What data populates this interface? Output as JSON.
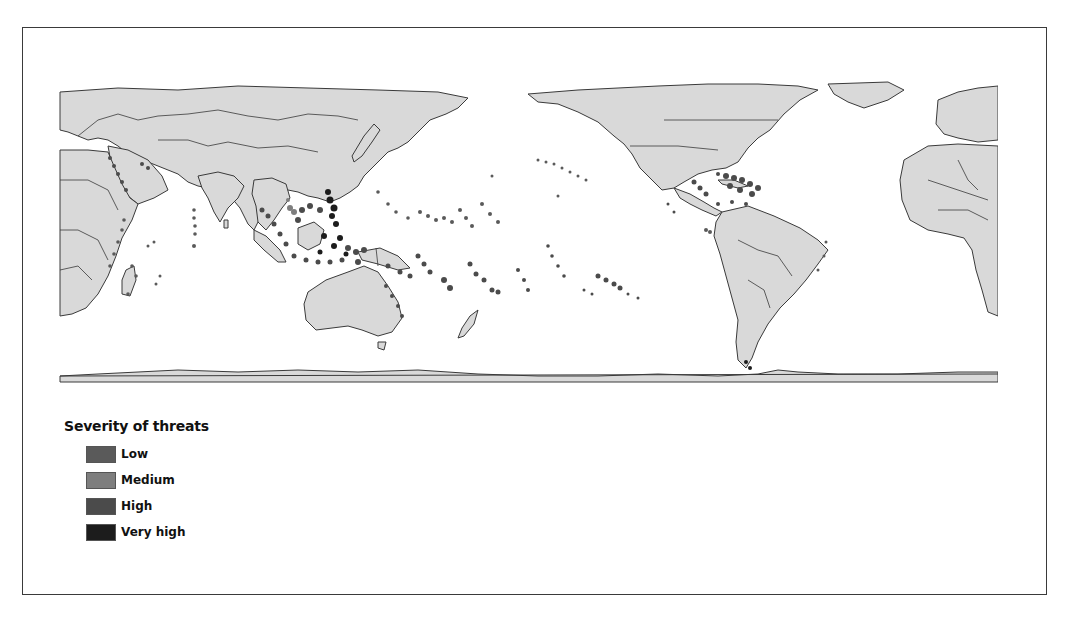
{
  "figure": {
    "type": "choropleth-world-map",
    "projection": "equirectangular, Pacific-centered",
    "land_color": "#d9d9d9",
    "border_color": "#3a3a3a",
    "ocean_color": "#ffffff"
  },
  "legend": {
    "title": "Severity of threats",
    "items": [
      {
        "label": "Low",
        "color": "#5a5a5a"
      },
      {
        "label": "Medium",
        "color": "#7e7e7e"
      },
      {
        "label": "High",
        "color": "#4b4b4b"
      },
      {
        "label": "Very high",
        "color": "#1c1c1c"
      }
    ]
  },
  "map_regions_highlighted": [
    "Red Sea",
    "Persian Gulf",
    "East Africa coast",
    "Madagascar",
    "Maldives / Chagos",
    "Southeast Asia / Coral Triangle",
    "Philippines",
    "Indonesia",
    "Papua New Guinea",
    "Great Barrier Reef",
    "Micronesia",
    "Melanesia",
    "Polynesia",
    "Hawaii",
    "Caribbean",
    "Gulf of Mexico",
    "Brazil coast"
  ]
}
